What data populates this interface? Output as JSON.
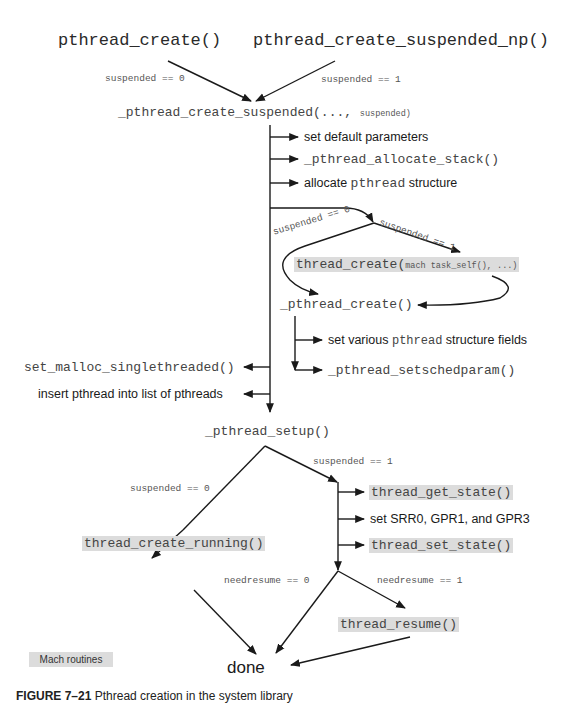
{
  "nodes": {
    "pthread_create": "pthread_create()",
    "pthread_create_suspended_np": "pthread_create_suspended_np()",
    "create_suspended_main": "_pthread_create_suspended(...,",
    "create_suspended_arg": "suspended)",
    "step_set_default": "set default parameters",
    "step_allocate_stack": "_pthread_allocate_stack()",
    "step_allocate_struct_pre": "allocate",
    "step_allocate_struct_mono": "pthread",
    "step_allocate_struct_post": "structure",
    "thread_create_main": "thread_create(",
    "thread_create_args": "mach task_self(), ...)",
    "underscore_pthread_create": "_pthread_create()",
    "set_fields_pre": "set various",
    "set_fields_mono": "pthread",
    "set_fields_post": "structure fields",
    "setschedparam": "_pthread_setschedparam()",
    "set_malloc": "set_malloc_singlethreaded()",
    "insert_pthread": "insert pthread into list of pthreads",
    "pthread_setup": "_pthread_setup()",
    "thread_get_state": "thread_get_state()",
    "set_srr0": "set SRR0, GPR1, and GPR3",
    "thread_set_state": "thread_set_state()",
    "thread_create_running": "thread_create_running()",
    "thread_resume": "thread_resume()",
    "done": "done"
  },
  "edge_labels": {
    "top_left": "suspended == 0",
    "top_right": "suspended == 1",
    "branch_left": "suspended == 0",
    "branch_right": "suspended == 1",
    "setup_left": "suspended == 0",
    "setup_right": "suspended == 1",
    "resume_left": "needresume == 0",
    "resume_right": "needresume == 1"
  },
  "legend": {
    "label": "Mach routines",
    "color": "#dcdcdc"
  },
  "caption": {
    "number": "FIGURE 7–21",
    "text": "Pthread creation in the system library"
  },
  "colors": {
    "line": "#1a1a1a",
    "highlight": "#dcdcdc",
    "text_mono": "#333333"
  }
}
